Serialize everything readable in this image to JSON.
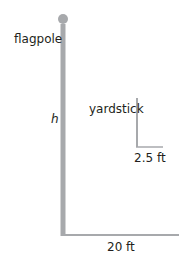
{
  "diagram": {
    "labels": {
      "flagpole": "flagpole",
      "height": "h",
      "yardstick": "yardstick",
      "yardstick_shadow": "2.5 ft",
      "flagpole_shadow": "20 ft"
    },
    "colors": {
      "line": "#a7a9ac",
      "text": "#231f20"
    }
  }
}
